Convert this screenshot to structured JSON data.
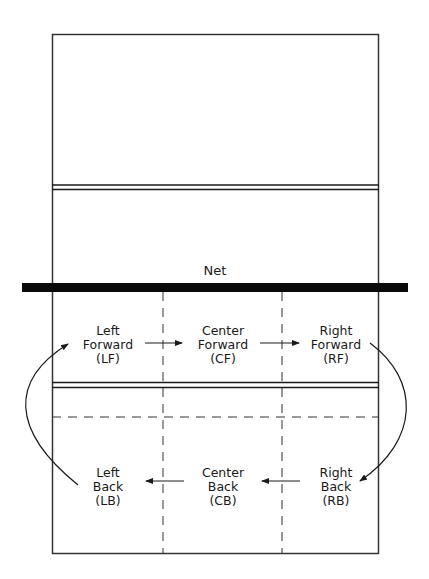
{
  "diagram": {
    "type": "volleyball-court-rotation",
    "net_label": "Net",
    "positions": {
      "forward": [
        {
          "id": "LF",
          "line1": "Left",
          "line2": "Forward",
          "line3": "(LF)"
        },
        {
          "id": "CF",
          "line1": "Center",
          "line2": "Forward",
          "line3": "(CF)"
        },
        {
          "id": "RF",
          "line1": "Right",
          "line2": "Forward",
          "line3": "(RF)"
        }
      ],
      "back": [
        {
          "id": "LB",
          "line1": "Left",
          "line2": "Back",
          "line3": "(LB)"
        },
        {
          "id": "CB",
          "line1": "Center",
          "line2": "Back",
          "line3": "(CB)"
        },
        {
          "id": "RB",
          "line1": "Right",
          "line2": "Back",
          "line3": "(RB)"
        }
      ]
    },
    "rotation_arrows": [
      {
        "from": "LF",
        "to": "CF"
      },
      {
        "from": "CF",
        "to": "RF"
      },
      {
        "from": "RF",
        "to": "RB"
      },
      {
        "from": "RB",
        "to": "CB"
      },
      {
        "from": "CB",
        "to": "LB"
      },
      {
        "from": "LB",
        "to": "LF"
      }
    ],
    "colors": {
      "line": "#1a1a1a",
      "net": "#0a0a0a",
      "background": "#ffffff"
    }
  }
}
